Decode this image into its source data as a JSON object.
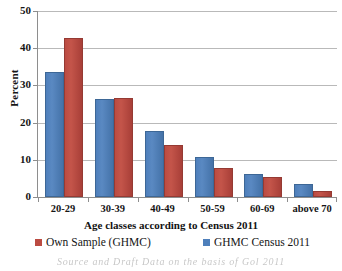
{
  "chart_data": {
    "type": "bar",
    "title": "",
    "xlabel": "Age classes according to Census 2011",
    "ylabel": "Percent",
    "categories": [
      "20-29",
      "30-39",
      "40-49",
      "50-59",
      "60-69",
      "above 70"
    ],
    "series": [
      {
        "name": "GHMC Census 2011",
        "color": "#4e7fbb",
        "values": [
          33.5,
          26.4,
          17.8,
          10.7,
          6.2,
          3.5
        ]
      },
      {
        "name": "Own Sample (GHMC)",
        "color": "#bb4b42",
        "values": [
          42.8,
          26.5,
          14.1,
          7.8,
          5.5,
          1.5
        ]
      }
    ],
    "ylim": [
      0,
      50
    ],
    "yticks": [
      0,
      10,
      20,
      30,
      40,
      50
    ],
    "ytick_labels": [
      "0",
      "10",
      "20",
      "30",
      "40",
      "50"
    ],
    "grid": true,
    "legend_position": "bottom"
  },
  "legend": {
    "entries": [
      {
        "label": "Own Sample (GHMC)",
        "color": "#bb4b42"
      },
      {
        "label": "GHMC Census 2011",
        "color": "#4e7fbb"
      }
    ]
  },
  "caption": {
    "source_line": "Source and Draft Data on the basis of Gol 2011"
  }
}
